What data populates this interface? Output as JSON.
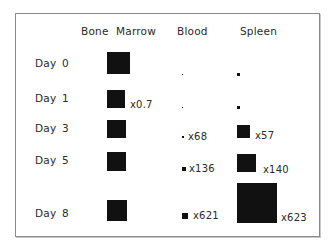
{
  "headers": {
    "bone": "Bone",
    "marrow": "Marrow",
    "blood": "Blood",
    "spleen": "Spleen"
  },
  "rows": [
    {
      "label": "Day",
      "day": "0",
      "bone_marrow": {
        "size": 23,
        "mult": ""
      },
      "blood": {
        "size": 1,
        "mult": ""
      },
      "spleen": {
        "size": 3,
        "mult": ""
      }
    },
    {
      "label": "Day",
      "day": "1",
      "bone_marrow": {
        "size": 18,
        "mult": "x0.7"
      },
      "blood": {
        "size": 1,
        "mult": ""
      },
      "spleen": {
        "size": 3,
        "mult": ""
      }
    },
    {
      "label": "Day",
      "day": "3",
      "bone_marrow": {
        "size": 19,
        "mult": ""
      },
      "blood": {
        "size": 2,
        "mult": "x68"
      },
      "spleen": {
        "size": 13,
        "mult": "x57"
      }
    },
    {
      "label": "Day",
      "day": "5",
      "bone_marrow": {
        "size": 19,
        "mult": ""
      },
      "blood": {
        "size": 4,
        "mult": "x136"
      },
      "spleen": {
        "size": 19,
        "mult": "x140"
      }
    },
    {
      "label": "Day",
      "day": "8",
      "bone_marrow": {
        "size": 20,
        "mult": ""
      },
      "blood": {
        "size": 6,
        "mult": "x621"
      },
      "spleen": {
        "size": 40,
        "mult": "x623"
      }
    }
  ],
  "colors": {
    "square": "#111111",
    "text": "#2a2a2a",
    "border": "#8a8a8a"
  }
}
